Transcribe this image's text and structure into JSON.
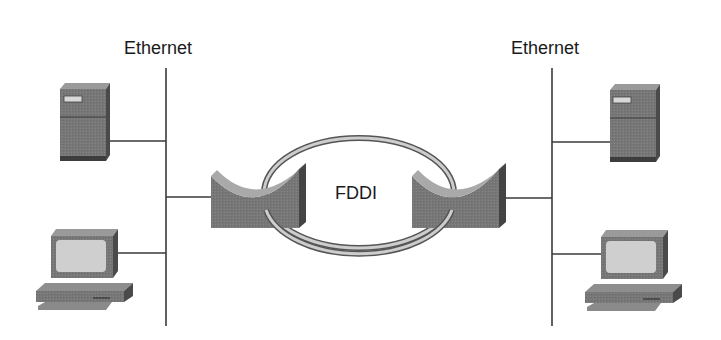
{
  "diagram": {
    "type": "network-topology",
    "labels": {
      "ethernet_left": "Ethernet",
      "ethernet_right": "Ethernet",
      "ring": "FDDI"
    },
    "segments": [
      {
        "id": "ethernet-left",
        "type": "Ethernet bus",
        "devices": [
          "server",
          "workstation",
          "router"
        ]
      },
      {
        "id": "fddi-ring",
        "type": "FDDI dual ring",
        "devices": [
          "router-left",
          "router-right"
        ]
      },
      {
        "id": "ethernet-right",
        "type": "Ethernet bus",
        "devices": [
          "server",
          "workstation",
          "router"
        ]
      }
    ],
    "colors": {
      "background": "#ffffff",
      "line": "#3a3a3a",
      "device_front": "#7a7a7a",
      "device_top": "#9a9a9a",
      "device_side": "#4a4a4a",
      "screen": "#cfcfcf",
      "router_curve": "#a8a8a8",
      "ring_fill": "#c8c8c8",
      "ring_stroke": "#555555"
    }
  }
}
